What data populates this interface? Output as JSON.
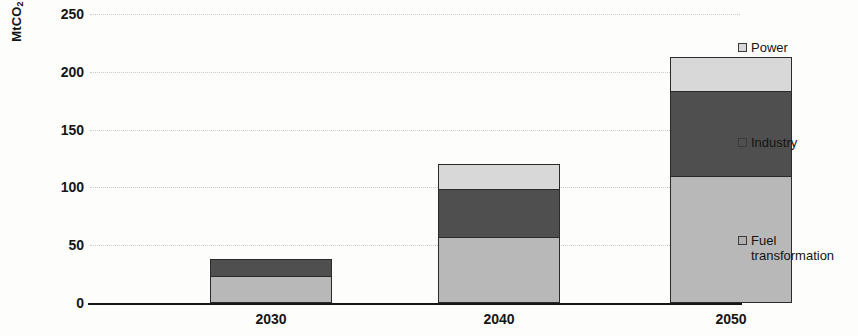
{
  "chart_data": {
    "type": "bar",
    "stacked": true,
    "title": "",
    "xlabel": "",
    "ylabel": "MtCO2",
    "ylabel_display": "MtCO",
    "ylabel_subscript": "2",
    "categories": [
      "2030",
      "2040",
      "2050"
    ],
    "series": [
      {
        "name": "Fuel transformation",
        "values": [
          23,
          57,
          110
        ],
        "color": "#b8b8b8"
      },
      {
        "name": "Industry",
        "values": [
          15,
          42,
          73
        ],
        "color": "#4f4f4f"
      },
      {
        "name": "Power",
        "values": [
          0,
          21,
          30
        ],
        "color": "#d8d8d8"
      }
    ],
    "totals": [
      38,
      120,
      213
    ],
    "ylim": [
      0,
      250
    ],
    "yticks": [
      0,
      50,
      100,
      150,
      200,
      250
    ],
    "ytick_labels": [
      "0",
      "50",
      "100",
      "150",
      "200",
      "250"
    ],
    "grid": true,
    "grid_axis": "y",
    "grid_style": "dotted",
    "legend_position": "right"
  },
  "legend": {
    "entries": [
      {
        "label": "Power",
        "swatch": "legend-swatch-power"
      },
      {
        "label": "Industry",
        "swatch": "legend-swatch-industry"
      },
      {
        "label": "Fuel\ntransformation",
        "swatch": "legend-swatch-fuel"
      }
    ]
  }
}
